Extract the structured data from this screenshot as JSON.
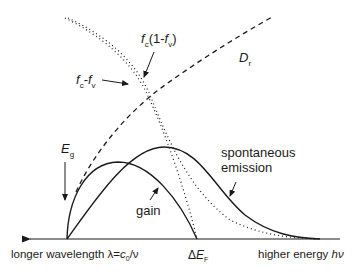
{
  "diagram": {
    "axis": {
      "left_label_text": "longer wavelength ",
      "left_label_lambda": "λ=",
      "left_label_c": "c",
      "left_label_c_sub": "0",
      "left_label_tail": "/ν",
      "right_label_text": "higher energy ",
      "right_label_hv": "hν",
      "mid_label_delta": "Δ",
      "mid_label_E": "E",
      "mid_label_sub": "F"
    },
    "labels": {
      "eg_main": "E",
      "eg_sub": "g",
      "dr_main": "D",
      "dr_sub": "r",
      "fcfv_fc": "f",
      "fcfv_fc_sub": "c",
      "fcfv_minus": "-",
      "fcfv_fv": "f",
      "fcfv_fv_sub": "v",
      "fc1fv_fc": "f",
      "fc1fv_fc_sub": "c",
      "fc1fv_open": "(1-",
      "fc1fv_fv": "f",
      "fc1fv_fv_sub": "v",
      "fc1fv_close": ")",
      "gain": "gain",
      "spont_line1": "spontaneous",
      "spont_line2": "emission"
    },
    "colors": {
      "stroke": "#1a1a1a",
      "background": "#ffffff"
    }
  }
}
